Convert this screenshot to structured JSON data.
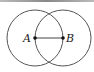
{
  "diagram": {
    "points": [
      {
        "label": "A",
        "x": 35,
        "y": 38
      },
      {
        "label": "B",
        "x": 63,
        "y": 38
      }
    ],
    "circles": [
      {
        "center": "A",
        "radius": 28
      },
      {
        "center": "B",
        "radius": 28
      }
    ],
    "segment": [
      "A",
      "B"
    ],
    "colors": {
      "stroke": "#555555",
      "point": "#111111"
    }
  }
}
